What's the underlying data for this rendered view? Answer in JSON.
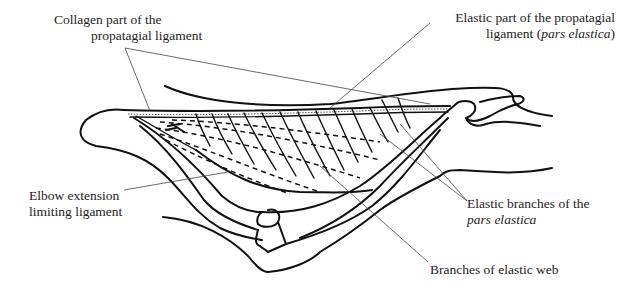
{
  "figure": {
    "labels": {
      "collagen": {
        "line1": "Collagen part of the",
        "line2": "propatagial ligament"
      },
      "elastic_part": {
        "line1": "Elastic part of the propatagial",
        "line2_prefix": "ligament (",
        "line2_italic": "pars elastica",
        "line2_suffix": ")"
      },
      "elbow": {
        "line1": "Elbow extension",
        "line2": "limiting ligament"
      },
      "elastic_branches": {
        "line1": "Elastic branches of the",
        "line2_italic": "pars elastica"
      },
      "web_branches": {
        "line1": "Branches of elastic web"
      }
    },
    "colors": {
      "ink": "#111111",
      "leader": "#444444",
      "text": "#222222",
      "background": "#ffffff"
    }
  }
}
